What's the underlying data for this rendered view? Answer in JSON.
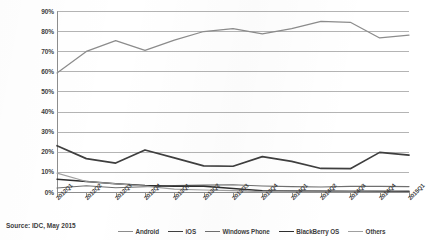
{
  "source_note": "Source: IDC, May 2015",
  "axis": {
    "y_ticks": [
      "90%",
      "80%",
      "70%",
      "60%",
      "50%",
      "40%",
      "30%",
      "20%",
      "10%",
      "0%"
    ],
    "x_ticks": [
      "2012Q1",
      "2012Q2",
      "2012Q3",
      "2012Q4",
      "2013Q1",
      "2013Q2",
      "2013Q3",
      "2013Q4",
      "2014Q1",
      "2014Q2",
      "2014Q3",
      "2014Q4",
      "2015Q1"
    ]
  },
  "legend": {
    "items": [
      {
        "label": "Android",
        "color": "#8c8c8c"
      },
      {
        "label": "iOS",
        "color": "#3f3f3f"
      },
      {
        "label": "Windows Phone",
        "color": "#6f6f6f"
      },
      {
        "label": "BlackBerry OS",
        "color": "#2e2e2e"
      },
      {
        "label": "Others",
        "color": "#a0a0a0"
      }
    ]
  },
  "chart_data": {
    "type": "line",
    "title": "",
    "subtitle": "",
    "xlabel": "",
    "ylabel": "",
    "ylim": [
      0,
      90
    ],
    "ytick_step": 10,
    "grid": true,
    "legend_position": "bottom",
    "annotations": [
      "Source: IDC, May 2015"
    ],
    "categories": [
      "2012Q1",
      "2012Q2",
      "2012Q3",
      "2012Q4",
      "2013Q1",
      "2013Q2",
      "2013Q3",
      "2013Q4",
      "2014Q1",
      "2014Q2",
      "2014Q3",
      "2014Q4",
      "2015Q1"
    ],
    "series": [
      {
        "name": "Android",
        "color": "#8c8c8c",
        "values": [
          59.2,
          69.9,
          75.3,
          70.4,
          75.5,
          79.8,
          81.2,
          78.6,
          81.2,
          84.8,
          84.4,
          76.6,
          78.0
        ]
      },
      {
        "name": "iOS",
        "color": "#3f3f3f",
        "values": [
          23.0,
          16.6,
          14.4,
          20.9,
          17.0,
          13.0,
          12.8,
          17.6,
          15.2,
          11.7,
          11.6,
          19.7,
          18.3
        ]
      },
      {
        "name": "Windows Phone",
        "color": "#6f6f6f",
        "values": [
          2.0,
          3.1,
          2.1,
          2.6,
          3.2,
          3.4,
          3.6,
          3.0,
          2.7,
          2.5,
          2.8,
          2.8,
          2.7
        ]
      },
      {
        "name": "BlackBerry OS",
        "color": "#2e2e2e",
        "values": [
          6.4,
          5.2,
          4.1,
          3.2,
          2.9,
          2.8,
          1.7,
          0.6,
          0.5,
          0.5,
          0.5,
          0.4,
          0.3
        ]
      },
      {
        "name": "Others",
        "color": "#a0a0a0",
        "values": [
          9.4,
          5.2,
          4.1,
          2.9,
          1.4,
          1.0,
          0.7,
          0.2,
          0.4,
          0.5,
          0.7,
          0.5,
          0.7
        ]
      }
    ]
  }
}
